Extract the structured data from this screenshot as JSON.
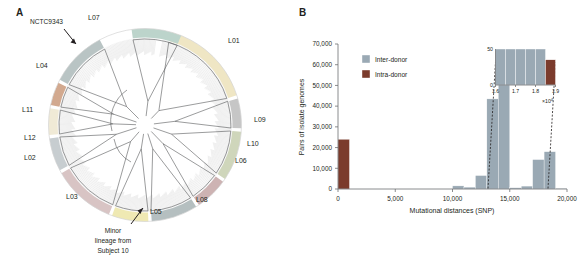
{
  "figure": {
    "panels": [
      {
        "id": "A",
        "label": "A"
      },
      {
        "id": "B",
        "label": "B"
      }
    ]
  },
  "panel_a": {
    "type": "circular-phylogenetic-tree",
    "lineage_labels": [
      {
        "name": "L01",
        "angle_deg": -52,
        "x": 228,
        "y": 43,
        "color": "#efe6c4"
      },
      {
        "name": "L02",
        "angle_deg": 160,
        "x": 24,
        "y": 160,
        "color": "#c7cdd0"
      },
      {
        "name": "L03",
        "angle_deg": 124,
        "x": 66,
        "y": 199,
        "color": "#d8c4c4"
      },
      {
        "name": "L04",
        "angle_deg": 227,
        "x": 36,
        "y": 68,
        "color": "#b9c4c4"
      },
      {
        "name": "L05",
        "angle_deg": 97,
        "x": 150,
        "y": 214,
        "color": "#efe9b3"
      },
      {
        "name": "L06",
        "angle_deg": 42,
        "x": 235,
        "y": 163,
        "color": "#cdb3b3"
      },
      {
        "name": "L07",
        "angle_deg": 283,
        "x": 88,
        "y": 20,
        "color": "#bcd4cb"
      },
      {
        "name": "L08",
        "angle_deg": 70,
        "x": 196,
        "y": 202,
        "color": "#b5bfc0"
      },
      {
        "name": "L09",
        "angle_deg": 4,
        "x": 254,
        "y": 122,
        "color": "#c6c6c6"
      },
      {
        "name": "L10",
        "angle_deg": 22,
        "x": 247,
        "y": 146,
        "color": "#cfd6bb"
      },
      {
        "name": "L11",
        "angle_deg": 188,
        "x": 22,
        "y": 112,
        "color": "#f0ead6"
      },
      {
        "name": "L12",
        "angle_deg": 172,
        "x": 24,
        "y": 140,
        "color": "#d2a98f"
      }
    ],
    "annotations": [
      {
        "id": "nctc",
        "text": "NCTC9343",
        "x": 30,
        "y": 24
      },
      {
        "id": "minor-lineage",
        "lines": [
          "Minor",
          "lineage from",
          "Subject 10"
        ],
        "x": 113,
        "y": 226
      }
    ]
  },
  "panel_b": {
    "legend": {
      "position": "top-left",
      "entries": [
        {
          "label": "Inter-donor",
          "color": "#9aa9b4"
        },
        {
          "label": "Intra-donor",
          "color": "#7b3b2c"
        }
      ]
    },
    "inset": {
      "ylabels": {
        "top": "50",
        "bottom": "0"
      },
      "xticks": [
        "1.6",
        "1.7",
        "1.8",
        "1.9"
      ],
      "exponent_label": "×10",
      "exponent_sup": "4"
    }
  },
  "chart_data": {
    "type": "bar",
    "title": "",
    "xlabel": "Mutational distances (SNP)",
    "ylabel": "Pairs of isolate genomes",
    "xlim": [
      0,
      20000
    ],
    "ylim": [
      0,
      70000
    ],
    "xticks": [
      0,
      5000,
      10000,
      15000,
      20000
    ],
    "xtick_labels": [
      "0",
      "5,000",
      "10,000",
      "15,000",
      "20,000"
    ],
    "yticks": [
      0,
      10000,
      20000,
      30000,
      40000,
      50000,
      60000,
      70000
    ],
    "ytick_labels": [
      "0",
      "10,000",
      "20,000",
      "30,000",
      "40,000",
      "50,000",
      "60,000",
      "70,000"
    ],
    "grid": false,
    "bin_width": 1000,
    "series": [
      {
        "name": "Intra-donor",
        "color": "#7b3b2c",
        "bins": [
          {
            "x0": 0,
            "x1": 1000,
            "value": 24000
          },
          {
            "x0": 18000,
            "x1": 19000,
            "value": 300
          }
        ]
      },
      {
        "name": "Inter-donor",
        "color": "#9aa9b4",
        "bins": [
          {
            "x0": 10000,
            "x1": 11000,
            "value": 1500
          },
          {
            "x0": 11000,
            "x1": 12000,
            "value": 900
          },
          {
            "x0": 12000,
            "x1": 13000,
            "value": 6500
          },
          {
            "x0": 13000,
            "x1": 14000,
            "value": 43500
          },
          {
            "x0": 14000,
            "x1": 15000,
            "value": 65000
          },
          {
            "x0": 15000,
            "x1": 16000,
            "value": 600
          },
          {
            "x0": 16000,
            "x1": 17000,
            "value": 1400
          },
          {
            "x0": 17000,
            "x1": 18000,
            "value": 14200
          },
          {
            "x0": 18000,
            "x1": 19000,
            "value": 18000
          },
          {
            "x0": 19000,
            "x1": 20000,
            "value": 300
          }
        ]
      }
    ],
    "inset_chart": {
      "type": "bar",
      "xlim": [
        16000,
        19000
      ],
      "ylim": [
        0,
        50
      ],
      "xticks": [
        16000,
        17000,
        18000,
        19000
      ],
      "xtick_labels": [
        "1.6",
        "1.7",
        "1.8",
        "1.9"
      ],
      "x_scale_note": "×10⁴",
      "ytick_labels": [
        "0",
        "50"
      ],
      "bins": [
        {
          "x0": 16000,
          "x1": 16500,
          "value": 50,
          "series": "Inter-donor",
          "color": "#9aa9b4"
        },
        {
          "x0": 16500,
          "x1": 17000,
          "value": 50,
          "series": "Inter-donor",
          "color": "#9aa9b4"
        },
        {
          "x0": 17000,
          "x1": 17500,
          "value": 50,
          "series": "Inter-donor",
          "color": "#9aa9b4"
        },
        {
          "x0": 17500,
          "x1": 18000,
          "value": 50,
          "series": "Inter-donor",
          "color": "#9aa9b4"
        },
        {
          "x0": 18000,
          "x1": 18500,
          "value": 50,
          "series": "Inter-donor",
          "color": "#9aa9b4"
        },
        {
          "x0": 18500,
          "x1": 19000,
          "value": 35,
          "series": "Intra-donor",
          "color": "#7b3b2c"
        }
      ]
    }
  }
}
